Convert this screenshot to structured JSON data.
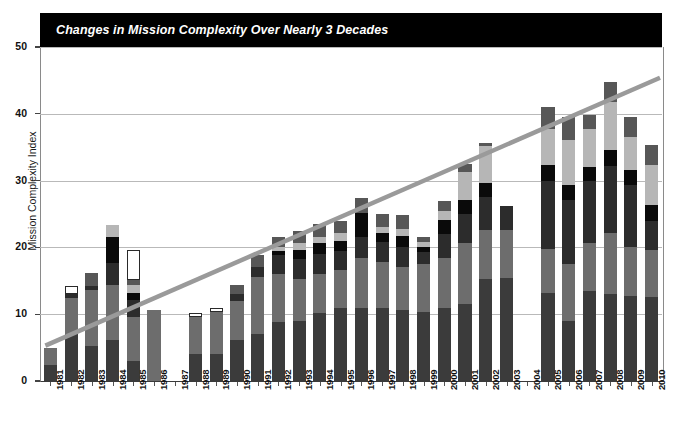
{
  "chart": {
    "title": "Changes in Mission Complexity Over Nearly 3 Decades",
    "ylabel": "Mission Complexity Index",
    "xlabel": ""
  },
  "colors": {
    "banner_background": "#000000",
    "banner_text": "#ffffff",
    "trendline": "#9a9a9a",
    "gridline": "#b9b9b9",
    "axis": "#555555",
    "plot_background": "#ffffff",
    "series": [
      "#3b3b3b",
      "#6d6d6d",
      "#2c2c2c",
      "#0a0a0a",
      "#b6b6b6",
      "#575757",
      "#ffffff"
    ]
  },
  "chart_data": {
    "type": "bar",
    "stacked": true,
    "title": "Changes in Mission Complexity Over Nearly 3 Decades",
    "xlabel": "",
    "ylabel": "Mission Complexity Index",
    "ylim": [
      0,
      50
    ],
    "yticks": [
      0,
      10,
      20,
      30,
      40,
      50
    ],
    "grid": true,
    "legend": false,
    "categories": [
      "1981",
      "1982",
      "1983",
      "1984",
      "1985",
      "1986",
      "1987",
      "1988",
      "1989",
      "1990",
      "1991",
      "1992",
      "1993",
      "1994",
      "1995",
      "1996",
      "1997",
      "1998",
      "1999",
      "2000",
      "2001",
      "2002",
      "2003",
      "2004",
      "2005",
      "2006",
      "2007",
      "2008",
      "2009",
      "2010"
    ],
    "series": [
      {
        "name": "Segment 1",
        "color": "#3b3b3b",
        "values": [
          2.4,
          7.0,
          5.2,
          6.2,
          3.0,
          0.0,
          0.0,
          4.0,
          4.0,
          6.2,
          7.0,
          8.8,
          9.0,
          10.2,
          11.0,
          11.0,
          11.0,
          10.6,
          10.3,
          11.0,
          11.6,
          15.2,
          15.4,
          0.0,
          13.2,
          9.0,
          13.5,
          13.0,
          12.8,
          12.6
        ]
      },
      {
        "name": "Segment 2",
        "color": "#6d6d6d",
        "values": [
          2.6,
          5.5,
          8.5,
          8.2,
          6.6,
          10.7,
          0.0,
          5.6,
          6.4,
          5.8,
          8.5,
          7.2,
          6.2,
          5.8,
          5.6,
          7.4,
          6.8,
          6.5,
          7.2,
          7.4,
          9.0,
          7.4,
          7.2,
          0.0,
          6.5,
          8.5,
          7.2,
          9.2,
          7.2,
          7.0
        ]
      },
      {
        "name": "Segment 3",
        "color": "#2c2c2c",
        "values": [
          0.0,
          0.6,
          0.6,
          3.2,
          2.6,
          0.0,
          0.0,
          0.0,
          0.0,
          1.0,
          1.6,
          2.8,
          3.0,
          3.0,
          2.8,
          3.2,
          3.0,
          3.0,
          1.8,
          3.6,
          4.4,
          5.0,
          3.6,
          0.0,
          10.2,
          9.6,
          9.2,
          10.0,
          9.4,
          4.4
        ]
      },
      {
        "name": "Segment 4",
        "color": "#0a0a0a",
        "values": [
          0.0,
          0.0,
          0.0,
          4.0,
          1.0,
          0.0,
          0.0,
          0.0,
          0.0,
          0.0,
          0.0,
          0.7,
          1.4,
          1.6,
          1.6,
          3.6,
          1.4,
          1.6,
          0.8,
          2.1,
          2.1,
          2.0,
          0.0,
          0.0,
          2.4,
          2.2,
          2.2,
          2.4,
          2.2,
          2.4
        ]
      },
      {
        "name": "Segment 5",
        "color": "#b6b6b6",
        "values": [
          0.0,
          0.0,
          0.0,
          1.8,
          1.2,
          0.0,
          0.0,
          0.0,
          0.0,
          0.0,
          0.0,
          0.6,
          1.0,
          0.9,
          1.2,
          0.0,
          0.8,
          1.0,
          0.7,
          1.3,
          4.2,
          5.6,
          0.0,
          0.0,
          5.4,
          6.8,
          5.6,
          7.2,
          5.0,
          6.0
        ]
      },
      {
        "name": "Segment 6",
        "color": "#575757",
        "values": [
          0.0,
          0.0,
          1.9,
          0.0,
          0.8,
          0.0,
          0.0,
          0.0,
          0.0,
          1.4,
          1.8,
          1.4,
          1.8,
          2.0,
          1.8,
          2.2,
          2.0,
          2.2,
          0.8,
          1.6,
          1.2,
          0.4,
          0.0,
          0.0,
          3.4,
          3.5,
          2.2,
          3.0,
          2.9,
          3.0
        ]
      },
      {
        "name": "Segment 7",
        "color": "#ffffff",
        "values": [
          0.0,
          1.2,
          0.0,
          0.0,
          4.4,
          0.0,
          0.0,
          0.6,
          0.6,
          0.0,
          0.0,
          0.0,
          0.0,
          0.0,
          0.0,
          0.0,
          0.0,
          0.0,
          0.0,
          0.0,
          0.0,
          0.0,
          0.0,
          0.0,
          0.0,
          0.0,
          0.0,
          0.0,
          0.0,
          0.0
        ]
      }
    ],
    "totals": [
      5.0,
      14.3,
      16.5,
      23.4,
      20.2,
      10.7,
      0.0,
      10.2,
      11.0,
      14.4,
      18.9,
      21.5,
      22.4,
      23.5,
      24.0,
      27.4,
      25.0,
      24.9,
      21.6,
      27.0,
      32.5,
      35.6,
      26.2,
      0.0,
      41.1,
      39.6,
      39.9,
      44.8,
      39.5,
      35.4
    ],
    "annotations": [
      {
        "type": "trendline",
        "label": "linear trend",
        "x_start": "1981",
        "y_start": 5.3,
        "x_end": "2010",
        "y_end": 45.4,
        "color": "#9a9a9a"
      }
    ]
  }
}
